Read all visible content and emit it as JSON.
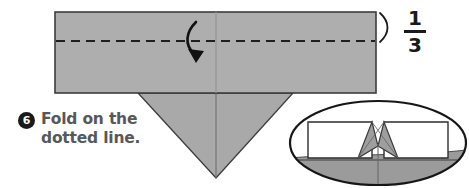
{
  "figure": {
    "step": {
      "number": "6",
      "instruction_line1": "Fold on the",
      "instruction_line2": "dotted line.",
      "instruction_full": "Fold on the dotted line."
    },
    "measurement": {
      "numerator": "1",
      "denominator": "3",
      "label": "1/3",
      "bracket_icon": "measure-bracket-icon"
    },
    "annotations": {
      "fold_arrow": "curved-fold-arrow-icon",
      "fold_line": "dashed-fold-line",
      "center_crease": "vertical-center-crease"
    },
    "shapes": {
      "main_sheet": "paper-rectangle",
      "lower_flap": "downward-triangle-flap",
      "detail_inset": "oval-detail-inset"
    },
    "colors": {
      "paper_gray": "#ababab",
      "paper_gray_light": "#b4b4b4",
      "flap_gray": "#a8a8a8",
      "outline": "#3c3c3c",
      "ink_dark": "#1a1a1a",
      "text_gray": "#58585a",
      "inset_white": "#ffffff",
      "inset_shadow": "#9d9d9d",
      "background": "#ffffff"
    }
  }
}
